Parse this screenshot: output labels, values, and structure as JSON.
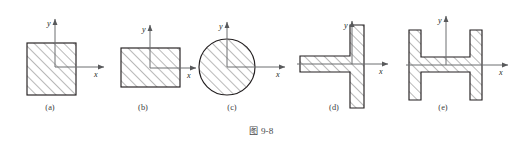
{
  "figure": {
    "caption_cjk": "图",
    "caption_number": "9-8",
    "caption_full": "图 9-8",
    "background_color": "#ffffff",
    "outline_color": "#231f20",
    "axis_color": "#6d6e71",
    "hatch_color": "#5a5a5c",
    "label_color": "#3b3b3d"
  },
  "axes": {
    "x_label": "x",
    "y_label": "y"
  },
  "subfigures": [
    {
      "id": "a",
      "label": "(a)",
      "shape": "square",
      "shape_name": "square-cross-section",
      "label_x": 50,
      "label_y": 110,
      "origin": {
        "x": 55,
        "y": 67
      },
      "rect": {
        "x": 27,
        "y": 43,
        "w": 49,
        "h": 52
      },
      "x_axis_end": 104,
      "y_axis_top": 19,
      "x_label_pos": {
        "x": 94,
        "y": 77
      },
      "y_label_pos": {
        "x": 47,
        "y": 26
      }
    },
    {
      "id": "b",
      "label": "(b)",
      "shape": "rectangle",
      "shape_name": "rectangle-cross-section",
      "label_x": 143,
      "label_y": 110,
      "origin": {
        "x": 150,
        "y": 68
      },
      "rect": {
        "x": 121,
        "y": 48,
        "w": 59,
        "h": 39
      },
      "x_axis_end": 196,
      "y_axis_top": 25,
      "x_label_pos": {
        "x": 187,
        "y": 78
      },
      "y_label_pos": {
        "x": 142,
        "y": 32
      }
    },
    {
      "id": "c",
      "label": "(c)",
      "shape": "circle",
      "shape_name": "circular-cross-section",
      "label_x": 232,
      "label_y": 110,
      "origin": {
        "x": 227,
        "y": 67
      },
      "circle": {
        "cx": 227,
        "cy": 67,
        "r": 28
      },
      "x_axis_end": 285,
      "y_axis_top": 22,
      "x_label_pos": {
        "x": 276,
        "y": 77
      },
      "y_label_pos": {
        "x": 219,
        "y": 29
      }
    },
    {
      "id": "d",
      "label": "(d)",
      "shape": "tee",
      "shape_name": "tee-cross-section",
      "label_x": 334,
      "label_y": 110,
      "origin": {
        "x": 352,
        "y": 64
      },
      "flange": {
        "x": 350,
        "y": 25,
        "w": 14,
        "h": 83
      },
      "web": {
        "x": 300,
        "y": 56,
        "w": 50,
        "h": 16
      },
      "x_axis_start": 297,
      "x_axis_end": 388,
      "y_axis_top": 21,
      "x_label_pos": {
        "x": 379,
        "y": 74
      },
      "y_label_pos": {
        "x": 344,
        "y": 28
      }
    },
    {
      "id": "e",
      "label": "(e)",
      "shape": "i-beam",
      "shape_name": "i-beam-cross-section",
      "label_x": 443,
      "label_y": 110,
      "origin": {
        "x": 446,
        "y": 65
      },
      "left_flange": {
        "x": 409,
        "y": 30,
        "w": 12,
        "h": 70
      },
      "right_flange": {
        "x": 470,
        "y": 30,
        "w": 12,
        "h": 70
      },
      "web": {
        "x": 409,
        "y": 57,
        "w": 73,
        "h": 15
      },
      "x_axis_start": 406,
      "x_axis_end": 508,
      "y_axis_top": 16,
      "x_label_pos": {
        "x": 499,
        "y": 75
      },
      "y_label_pos": {
        "x": 438,
        "y": 23
      }
    }
  ]
}
